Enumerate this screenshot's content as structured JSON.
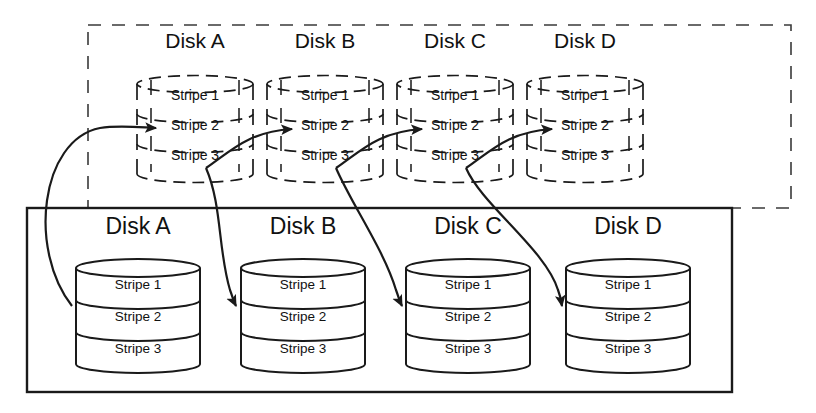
{
  "diagram": {
    "title_text": "",
    "colors": {
      "stroke": "#1a1a1a",
      "background": "#ffffff",
      "dashed_stroke": "#1a1a1a"
    },
    "logical_group": {
      "name": "logical-volume-dashed-group",
      "border_style": "dashed",
      "disks": [
        {
          "label": "Disk A",
          "stripes": [
            "Stripe 1",
            "Stripe 2",
            "Stripe 3"
          ]
        },
        {
          "label": "Disk B",
          "stripes": [
            "Stripe 1",
            "Stripe 2",
            "Stripe 3"
          ]
        },
        {
          "label": "Disk C",
          "stripes": [
            "Stripe 1",
            "Stripe 2",
            "Stripe 3"
          ]
        },
        {
          "label": "Disk D",
          "stripes": [
            "Stripe 1",
            "Stripe 2",
            "Stripe 3"
          ]
        }
      ]
    },
    "physical_group": {
      "name": "physical-disks-solid-group",
      "border_style": "solid",
      "disks": [
        {
          "label": "Disk A",
          "stripes": [
            "Stripe 1",
            "Stripe 2",
            "Stripe 3"
          ]
        },
        {
          "label": "Disk B",
          "stripes": [
            "Stripe 1",
            "Stripe 2",
            "Stripe 3"
          ]
        },
        {
          "label": "Disk C",
          "stripes": [
            "Stripe 1",
            "Stripe 2",
            "Stripe 3"
          ]
        },
        {
          "label": "Disk D",
          "stripes": [
            "Stripe 1",
            "Stripe 2",
            "Stripe 3"
          ]
        }
      ]
    },
    "connectors": [
      {
        "name": "arrow-logical-a-to-b",
        "kind": "horizontal-arrow"
      },
      {
        "name": "arrow-logical-b-to-c",
        "kind": "horizontal-arrow"
      },
      {
        "name": "arrow-logical-c-to-d",
        "kind": "horizontal-arrow"
      },
      {
        "name": "arrow-physical-a-to-logical-a",
        "kind": "curved-arrow"
      },
      {
        "name": "arrow-logical-a-to-physical-b",
        "kind": "curved-arrow"
      },
      {
        "name": "arrow-logical-b-to-physical-c",
        "kind": "curved-arrow"
      },
      {
        "name": "arrow-logical-c-to-physical-d",
        "kind": "curved-arrow"
      }
    ]
  }
}
